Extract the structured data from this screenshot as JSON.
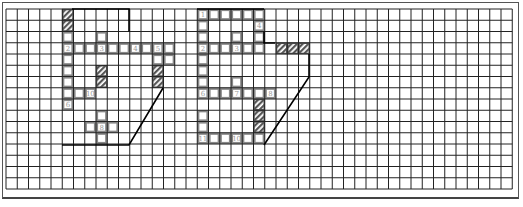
{
  "diagram": {
    "type": "grid-puzzle",
    "grid": {
      "cols": 45,
      "rows": 16,
      "origin_x": 6,
      "origin_y": 9,
      "cell": 11.25
    },
    "colors": {
      "grid_line": "#222222",
      "highlight_cell": "#888888",
      "hatch": "#555555",
      "outline": "#000000",
      "label": "#999999"
    },
    "figures": [
      {
        "name": "left-figure",
        "labels": [
          {
            "text": "2",
            "col": 5,
            "row": 3
          },
          {
            "text": "3",
            "col": 8,
            "row": 3
          },
          {
            "text": "4",
            "col": 11,
            "row": 3
          },
          {
            "text": "5",
            "col": 13,
            "row": 3
          },
          {
            "text": "10",
            "col": 7,
            "row": 7
          },
          {
            "text": "6",
            "col": 5,
            "row": 8
          },
          {
            "text": "8",
            "col": 8,
            "row": 10
          }
        ],
        "hatched": [
          [
            5,
            0
          ],
          [
            5,
            1
          ],
          [
            8,
            5
          ],
          [
            8,
            6
          ],
          [
            13,
            5
          ],
          [
            13,
            6
          ]
        ],
        "highlighted": [
          [
            5,
            2
          ],
          [
            5,
            3
          ],
          [
            6,
            3
          ],
          [
            7,
            3
          ],
          [
            8,
            3
          ],
          [
            9,
            3
          ],
          [
            10,
            3
          ],
          [
            11,
            3
          ],
          [
            12,
            3
          ],
          [
            13,
            3
          ],
          [
            14,
            3
          ],
          [
            8,
            2
          ],
          [
            5,
            4
          ],
          [
            5,
            5
          ],
          [
            5,
            6
          ],
          [
            5,
            7
          ],
          [
            6,
            7
          ],
          [
            7,
            7
          ],
          [
            5,
            8
          ],
          [
            8,
            9
          ],
          [
            7,
            10
          ],
          [
            8,
            10
          ],
          [
            9,
            10
          ],
          [
            8,
            11
          ],
          [
            13,
            4
          ],
          [
            14,
            4
          ]
        ]
      },
      {
        "name": "right-figure",
        "labels": [
          {
            "text": "1",
            "col": 17,
            "row": 0
          },
          {
            "text": "4",
            "col": 22,
            "row": 1
          },
          {
            "text": "2",
            "col": 17,
            "row": 3
          },
          {
            "text": "3",
            "col": 20,
            "row": 3
          },
          {
            "text": "6",
            "col": 17,
            "row": 7
          },
          {
            "text": "7",
            "col": 20,
            "row": 7
          },
          {
            "text": "8",
            "col": 23,
            "row": 7
          },
          {
            "text": "11",
            "col": 17,
            "row": 11
          },
          {
            "text": "10",
            "col": 20,
            "row": 11
          }
        ],
        "hatched": [
          [
            24,
            3
          ],
          [
            25,
            3
          ],
          [
            26,
            3
          ],
          [
            22,
            8
          ],
          [
            22,
            9
          ],
          [
            22,
            10
          ]
        ],
        "highlighted": [
          [
            17,
            0
          ],
          [
            18,
            0
          ],
          [
            19,
            0
          ],
          [
            20,
            0
          ],
          [
            21,
            0
          ],
          [
            22,
            0
          ],
          [
            17,
            1
          ],
          [
            17,
            2
          ],
          [
            17,
            3
          ],
          [
            18,
            3
          ],
          [
            19,
            3
          ],
          [
            20,
            3
          ],
          [
            21,
            3
          ],
          [
            22,
            3
          ],
          [
            22,
            1
          ],
          [
            22,
            2
          ],
          [
            17,
            4
          ],
          [
            17,
            5
          ],
          [
            17,
            6
          ],
          [
            17,
            7
          ],
          [
            18,
            7
          ],
          [
            19,
            7
          ],
          [
            20,
            7
          ],
          [
            21,
            7
          ],
          [
            22,
            7
          ],
          [
            23,
            7
          ],
          [
            17,
            9
          ],
          [
            17,
            10
          ],
          [
            17,
            11
          ],
          [
            18,
            11
          ],
          [
            19,
            11
          ],
          [
            20,
            11
          ],
          [
            21,
            11
          ],
          [
            22,
            11
          ],
          [
            20,
            2
          ],
          [
            20,
            6
          ]
        ]
      }
    ]
  }
}
